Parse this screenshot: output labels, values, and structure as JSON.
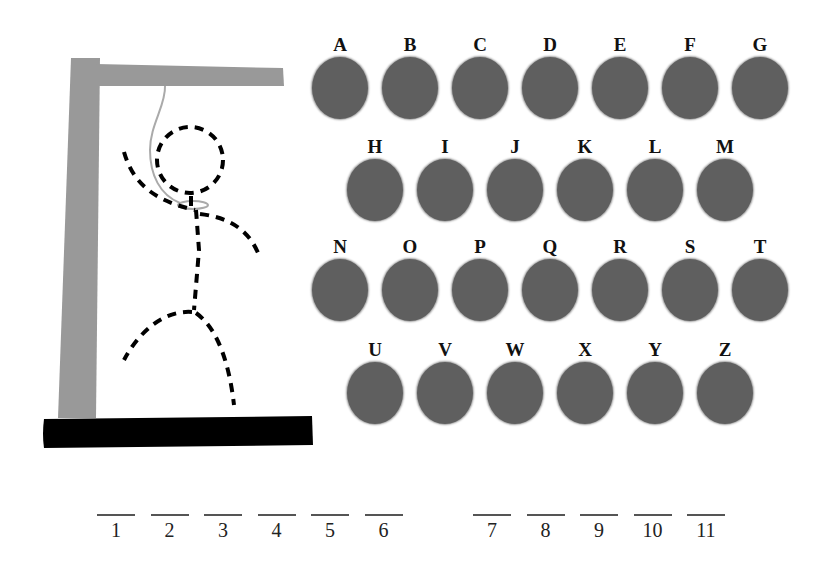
{
  "game": {
    "type": "hangman",
    "figure": {
      "parts_shown": [
        "head",
        "body",
        "left-arm",
        "right-arm",
        "left-leg",
        "right-leg"
      ],
      "style": "dashed",
      "noose": true
    },
    "colors": {
      "gallows": "#999999",
      "base": "#000000",
      "letter_button": "#5f5f5f",
      "figure": "#000000",
      "rope": "#aaaaaa"
    }
  },
  "keyboard": {
    "rows": [
      [
        "A",
        "B",
        "C",
        "D",
        "E",
        "F",
        "G"
      ],
      [
        "H",
        "I",
        "J",
        "K",
        "L",
        "M"
      ],
      [
        "N",
        "O",
        "P",
        "Q",
        "R",
        "S",
        "T"
      ],
      [
        "U",
        "V",
        "W",
        "X",
        "Y",
        "Z"
      ]
    ]
  },
  "word": {
    "groups": [
      [
        "1",
        "2",
        "3",
        "4",
        "5",
        "6"
      ],
      [
        "7",
        "8",
        "9",
        "10",
        "11"
      ]
    ],
    "slots": [
      "1",
      "2",
      "3",
      "4",
      "5",
      "6",
      "7",
      "8",
      "9",
      "10",
      "11"
    ]
  }
}
